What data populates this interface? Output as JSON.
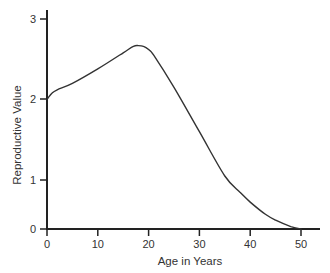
{
  "chart_data": {
    "type": "line",
    "title": "",
    "xlabel": "Age in Years",
    "ylabel": "Reproductive Value",
    "xlim": [
      0,
      54
    ],
    "ylim": [
      0,
      3
    ],
    "x_ticks": [
      0,
      10,
      20,
      30,
      40,
      50
    ],
    "y_ticks": [
      0,
      1,
      2,
      3
    ],
    "grid": false,
    "legend": null,
    "series": [
      {
        "name": "Reproductive Value",
        "x": [
          0,
          1,
          2,
          5,
          10,
          15,
          17,
          18,
          19,
          20,
          21,
          25,
          30,
          35,
          38,
          40,
          43,
          45,
          48,
          50
        ],
        "values": [
          2.0,
          2.08,
          2.12,
          2.2,
          2.38,
          2.58,
          2.66,
          2.67,
          2.66,
          2.62,
          2.55,
          2.15,
          1.6,
          1.05,
          0.75,
          0.55,
          0.3,
          0.18,
          0.05,
          0.0
        ]
      }
    ]
  },
  "axes": {
    "x_label": "Age in Years",
    "y_label": "Reproductive Value",
    "x_tick_labels": [
      "0",
      "10",
      "20",
      "30",
      "40",
      "50"
    ],
    "y_tick_labels": [
      "0",
      "1",
      "2",
      "3"
    ]
  }
}
